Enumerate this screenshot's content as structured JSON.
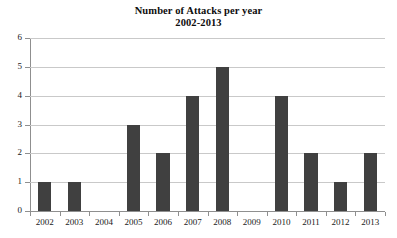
{
  "chart_data": {
    "type": "bar",
    "title": "Number of Attacks per year",
    "subtitle": "2002-2013",
    "categories": [
      "2002",
      "2003",
      "2004",
      "2005",
      "2006",
      "2007",
      "2008",
      "2009",
      "2010",
      "2011",
      "2012",
      "2013"
    ],
    "values": [
      1,
      1,
      0,
      3,
      2,
      4,
      5,
      0,
      4,
      2,
      1,
      2
    ],
    "xlabel": "",
    "ylabel": "",
    "ylim": [
      0,
      6
    ],
    "yticks": [
      "0",
      "1",
      "2",
      "3",
      "4",
      "5",
      "6"
    ],
    "grid": "horizontal",
    "legend": "none",
    "bar_color": "#404040",
    "gridline_color": "#c9c9c9",
    "axis_color": "#8f8f8f",
    "background_color": "#ffffff"
  }
}
